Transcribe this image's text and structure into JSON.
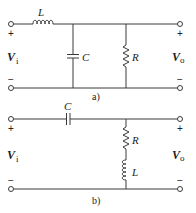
{
  "circuits": [
    {
      "caption": "a)",
      "input_label": {
        "main": "V",
        "sub": "i"
      },
      "output_label": {
        "main": "V",
        "sub": "o"
      },
      "plus": "+",
      "minus": "−",
      "components": {
        "inductor": "L",
        "capacitor": "C",
        "resistor": "R"
      }
    },
    {
      "caption": "b)",
      "input_label": {
        "main": "V",
        "sub": "i"
      },
      "output_label": {
        "main": "V",
        "sub": "o"
      },
      "plus": "+",
      "minus": "−",
      "components": {
        "capacitor": "C",
        "resistor": "R",
        "inductor": "L"
      }
    }
  ],
  "colors": {
    "wire": "#3a3a3a",
    "text": "#222222",
    "background": "#ffffff"
  }
}
